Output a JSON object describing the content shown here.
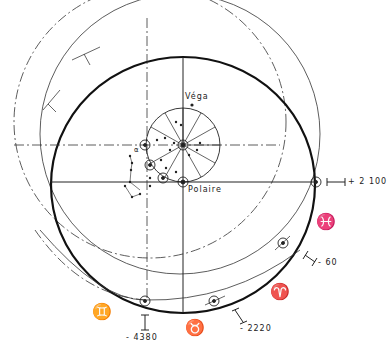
{
  "diagram": {
    "type": "celestial-pole-precession",
    "labels": {
      "vega": "Véga",
      "polaire": "Polaire",
      "alpha": "α"
    },
    "dates": {
      "d_plus_2100": "+ 2 100",
      "d_minus_60": "- 60",
      "d_minus_2220": "- 2220",
      "d_minus_4380": "- 4380"
    },
    "zodiac": {
      "pisces": "♓",
      "aries": "♈",
      "taurus": "♉",
      "gemini": "♊"
    },
    "colors": {
      "ink": "#222222",
      "background": "#ffffff"
    }
  }
}
